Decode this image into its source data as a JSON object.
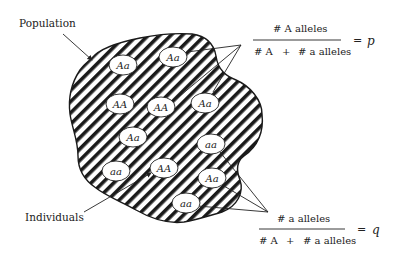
{
  "labels": {
    "population": "Population",
    "individuals": "Individuals"
  },
  "individuals": [
    {
      "genotype": "Aa",
      "cx": 123,
      "cy": 65
    },
    {
      "genotype": "Aa",
      "cx": 173,
      "cy": 57
    },
    {
      "genotype": "AA",
      "cx": 120,
      "cy": 104
    },
    {
      "genotype": "AA",
      "cx": 161,
      "cy": 107
    },
    {
      "genotype": "Aa",
      "cx": 205,
      "cy": 103
    },
    {
      "genotype": "Aa",
      "cx": 133,
      "cy": 137
    },
    {
      "genotype": "aa",
      "cx": 211,
      "cy": 144
    },
    {
      "genotype": "aa",
      "cx": 116,
      "cy": 171
    },
    {
      "genotype": "AA",
      "cx": 164,
      "cy": 168
    },
    {
      "genotype": "Aa",
      "cx": 212,
      "cy": 178
    },
    {
      "genotype": "aa",
      "cx": 186,
      "cy": 203
    }
  ],
  "formula_p": {
    "numerator": "# A alleles",
    "denominator_left": "# A",
    "plus": "+",
    "denominator_right": "# a alleles",
    "equals": "=",
    "variable": "p"
  },
  "formula_q": {
    "numerator": "# a  alleles",
    "denominator_left": "# A",
    "plus": "+",
    "denominator_right": "# a alleles",
    "equals": "=",
    "variable": "q"
  },
  "colors": {
    "ink": "#222222",
    "background": "#ffffff",
    "oval_fill": "#ffffff"
  }
}
